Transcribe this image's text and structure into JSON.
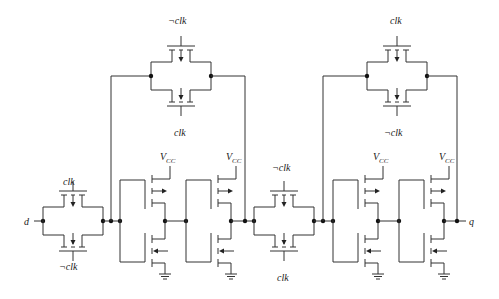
{
  "diagram": {
    "labels": {
      "input": "d",
      "output": "q",
      "clk": "clk",
      "not_clk": "¬clk",
      "vcc_main": "V",
      "vcc_sub": "CC"
    },
    "transmission_gates": [
      {
        "id": "tg-input",
        "top": "clk",
        "bottom": "¬clk"
      },
      {
        "id": "tg-master-feedback",
        "top": "¬clk",
        "bottom": "clk"
      },
      {
        "id": "tg-middle",
        "top": "¬clk",
        "bottom": "clk"
      },
      {
        "id": "tg-slave-feedback",
        "top": "clk",
        "bottom": "¬clk"
      }
    ],
    "inverters": [
      {
        "id": "inv-1",
        "supply": "VCC"
      },
      {
        "id": "inv-2",
        "supply": "VCC"
      },
      {
        "id": "inv-3",
        "supply": "VCC"
      },
      {
        "id": "inv-4",
        "supply": "VCC"
      }
    ]
  }
}
